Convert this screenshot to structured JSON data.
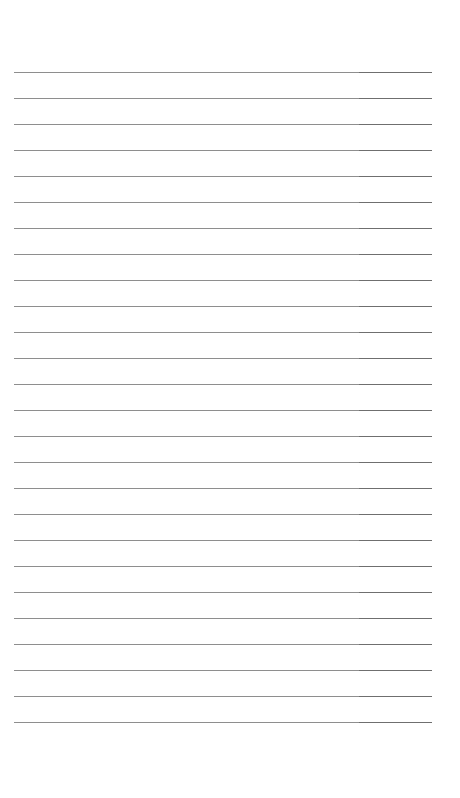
{
  "document": {
    "type": "ruled-paper",
    "line_count": 26,
    "first_line_y": 72,
    "line_spacing": 26,
    "line_left": 14,
    "line_right": 432,
    "split_x": 359,
    "colors": {
      "background": "#ffffff",
      "line_main": "#8e8e8e",
      "line_right": "#6f6f6f"
    }
  }
}
